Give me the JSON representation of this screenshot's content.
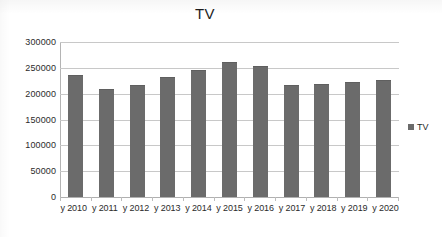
{
  "chart_data": {
    "type": "bar",
    "title": "TV",
    "xlabel": "",
    "ylabel": "",
    "categories": [
      "y 2010",
      "y 2011",
      "y 2012",
      "y 2013",
      "y 2014",
      "y 2015",
      "y 2016",
      "y 2017",
      "y 2018",
      "y 2019",
      "y 2020"
    ],
    "series": [
      {
        "name": "TV",
        "values": [
          235000,
          207000,
          215000,
          230000,
          243000,
          260000,
          251000,
          215000,
          217000,
          221000,
          224000
        ]
      }
    ],
    "ylim": [
      0,
      300000
    ],
    "y_ticks": [
      0,
      50000,
      100000,
      150000,
      200000,
      250000,
      300000
    ],
    "y_tick_labels": [
      "0",
      "50000",
      "100000",
      "150000",
      "200000",
      "250000",
      "300000"
    ],
    "grid": true,
    "legend": {
      "position": "right",
      "entries": [
        {
          "label": "TV",
          "color": "#6b6b6b",
          "marker": "square"
        }
      ]
    },
    "colors": {
      "bar": "#6b6b6b",
      "gridline": "#c8c8c8",
      "axis": "#b4b4b4",
      "text": "#2b2b2b",
      "background": "#ffffff"
    }
  }
}
